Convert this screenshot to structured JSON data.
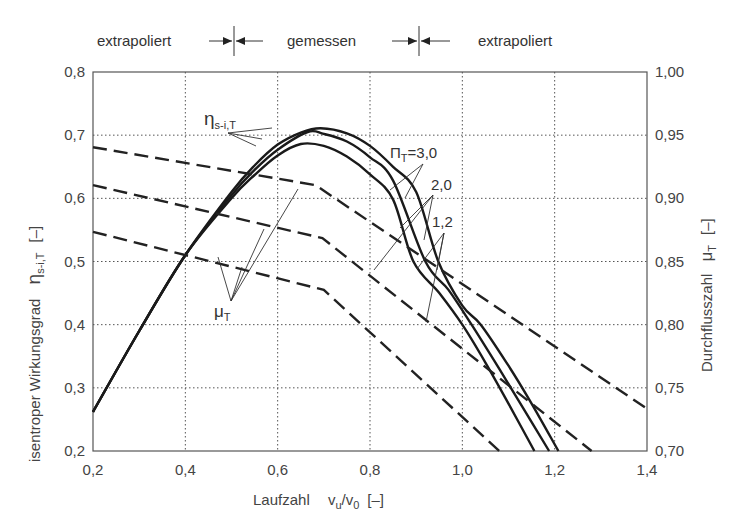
{
  "chart_data": {
    "type": "line",
    "title": "",
    "header": {
      "left": "extrapoliert",
      "middle": "gemessen",
      "right": "extrapoliert",
      "boundaries_x": [
        0.5,
        0.93
      ]
    },
    "xlabel": "Laufzahl",
    "xlabel_symbol": "v",
    "xlabel_sub_num": "u",
    "xlabel_den": "v",
    "xlabel_sub_den": "0",
    "xlabel_unit": "[–]",
    "ylabel": "isentroper Wirkungsgrad",
    "ylabel_symbol": "η",
    "ylabel_sub": "s-i,T",
    "ylabel_unit": "[–]",
    "y2label": "Durchflusszahl",
    "y2label_symbol": "μ",
    "y2label_sub": "T",
    "y2label_unit": "[–]",
    "xlim": [
      0.2,
      1.4
    ],
    "ylim": [
      0.2,
      0.8
    ],
    "y2lim": [
      0.7,
      1.0
    ],
    "xticks": [
      "0,2",
      "0,4",
      "0,6",
      "0,8",
      "1,0",
      "1,2",
      "1,4"
    ],
    "xtick_values": [
      0.2,
      0.4,
      0.6,
      0.8,
      1.0,
      1.2,
      1.4
    ],
    "yticks": [
      "0,2",
      "0,3",
      "0,4",
      "0,5",
      "0,6",
      "0,7",
      "0,8"
    ],
    "ytick_values": [
      0.2,
      0.3,
      0.4,
      0.5,
      0.6,
      0.7,
      0.8
    ],
    "y2ticks": [
      "0,70",
      "0,75",
      "0,80",
      "0,85",
      "0,90",
      "0,95",
      "1,00"
    ],
    "y2tick_values": [
      0.7,
      0.75,
      0.8,
      0.85,
      0.9,
      0.95,
      1.0
    ],
    "grid": true,
    "series": [
      {
        "name": "eta_s-i,T, Pi_T=3,0",
        "axis": "left",
        "style": "solid",
        "x": [
          0.2,
          0.3,
          0.4,
          0.5,
          0.55,
          0.6,
          0.65,
          0.693,
          0.75,
          0.8,
          0.85,
          0.9,
          0.948,
          1.0,
          1.04,
          1.1,
          1.15,
          1.208
        ],
        "y": [
          0.262,
          0.39,
          0.51,
          0.61,
          0.652,
          0.685,
          0.704,
          0.711,
          0.703,
          0.683,
          0.65,
          0.61,
          0.5,
          0.43,
          0.4,
          0.335,
          0.275,
          0.2
        ]
      },
      {
        "name": "eta_s-i,T, Pi_T=2,0",
        "axis": "left",
        "style": "solid",
        "x": [
          0.2,
          0.3,
          0.4,
          0.5,
          0.55,
          0.6,
          0.665,
          0.7,
          0.75,
          0.8,
          0.85,
          0.92,
          0.97,
          1.02,
          1.08,
          1.13,
          1.188
        ],
        "y": [
          0.262,
          0.39,
          0.51,
          0.605,
          0.645,
          0.677,
          0.705,
          0.702,
          0.69,
          0.665,
          0.628,
          0.5,
          0.455,
          0.4,
          0.33,
          0.27,
          0.2
        ]
      },
      {
        "name": "eta_s-i,T, Pi_T=1,2",
        "axis": "left",
        "style": "solid",
        "x": [
          0.2,
          0.3,
          0.4,
          0.5,
          0.55,
          0.6,
          0.65,
          0.7,
          0.75,
          0.8,
          0.85,
          0.894,
          0.95,
          1.0,
          1.05,
          1.1,
          1.156
        ],
        "y": [
          0.262,
          0.39,
          0.51,
          0.6,
          0.637,
          0.668,
          0.686,
          0.683,
          0.666,
          0.638,
          0.598,
          0.5,
          0.45,
          0.4,
          0.34,
          0.275,
          0.2
        ]
      },
      {
        "name": "mu_T, Pi_T=3,0",
        "axis": "right",
        "style": "dashed",
        "x": [
          0.2,
          0.682,
          1.4
        ],
        "y": [
          0.9405,
          0.9105,
          0.7335
        ]
      },
      {
        "name": "mu_T, Pi_T=2,0",
        "axis": "right",
        "style": "dashed",
        "x": [
          0.2,
          0.697,
          1.28
        ],
        "y": [
          0.9105,
          0.8685,
          0.7
        ]
      },
      {
        "name": "mu_T, Pi_T=1,2",
        "axis": "right",
        "style": "dashed",
        "x": [
          0.2,
          0.7,
          1.08
        ],
        "y": [
          0.8735,
          0.8275,
          0.7
        ]
      }
    ],
    "annotations": {
      "eta_label": "η",
      "eta_sub": "s-i,T",
      "mu_label": "μ",
      "mu_sub": "T",
      "pi_label": "Π",
      "pi_sub": "T",
      "pi_values": [
        "=3,0",
        "2,0",
        "1,2"
      ]
    }
  }
}
